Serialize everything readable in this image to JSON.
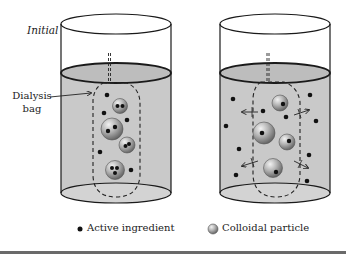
{
  "figure": {
    "label_initial": "Initial",
    "label_dialysis_line1": "Dialysis",
    "label_dialysis_line2": "bag",
    "legend": {
      "active_ingredient": "Active ingredient",
      "colloidal_particle": "Colloidal particle"
    },
    "colors": {
      "liquid": "#c9c9c9",
      "outline": "#1a1a1a",
      "particle_light": "#e6e6e6",
      "particle_dark": "#6e6e6e",
      "dot": "#111111"
    },
    "beakers": [
      {
        "id": "initial",
        "colloids": [
          {
            "cx": 120,
            "cy": 106,
            "r": 7.5,
            "dots": 2
          },
          {
            "cx": 112,
            "cy": 129,
            "r": 11,
            "dots": 2
          },
          {
            "cx": 127,
            "cy": 145,
            "r": 8,
            "dots": 2
          },
          {
            "cx": 115,
            "cy": 170,
            "r": 9.5,
            "dots": 3
          }
        ],
        "free_dots": [
          [
            107,
            95
          ],
          [
            104,
            113
          ],
          [
            127,
            120
          ],
          [
            100,
            152
          ],
          [
            131,
            170
          ]
        ]
      },
      {
        "id": "release",
        "colloids": [
          {
            "cx": 280,
            "cy": 103,
            "r": 8,
            "dots": 1
          },
          {
            "cx": 264,
            "cy": 133,
            "r": 11,
            "dots": 1
          },
          {
            "cx": 287,
            "cy": 142,
            "r": 8,
            "dots": 1
          },
          {
            "cx": 273,
            "cy": 168,
            "r": 9.5,
            "dots": 1
          }
        ],
        "free_dots": [
          [
            233,
            99
          ],
          [
            310,
            95
          ],
          [
            263,
            111
          ],
          [
            286,
            117
          ],
          [
            316,
            121
          ],
          [
            226,
            126
          ],
          [
            239,
            149
          ],
          [
            309,
            155
          ],
          [
            236,
            175
          ],
          [
            307,
            181
          ]
        ],
        "diffusion_arrows": 4
      }
    ]
  }
}
